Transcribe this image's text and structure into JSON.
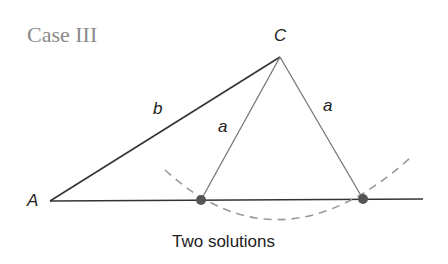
{
  "title": "Case III",
  "labels": {
    "vertex_a": "A",
    "vertex_c": "C",
    "side_b": "b",
    "side_a_left": "a",
    "side_a_right": "a"
  },
  "caption": "Two solutions",
  "colors": {
    "title": "#8a8a8a",
    "lines": "#333333",
    "side_a": "#777777",
    "arc": "#999999",
    "points": "#555555"
  },
  "geometry": {
    "A": [
      50,
      201
    ],
    "C": [
      280,
      57
    ],
    "B1": [
      201,
      200
    ],
    "B2": [
      363,
      199
    ],
    "baseline_end": [
      423,
      199
    ]
  }
}
